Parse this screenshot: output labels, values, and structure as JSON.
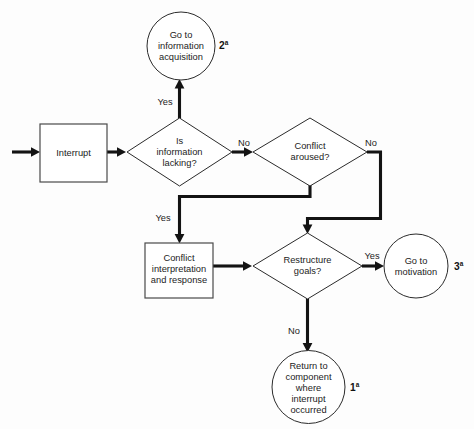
{
  "diagram": {
    "type": "flowchart",
    "background_color": "#fdfdfd",
    "line_color": "#131313",
    "shape_stroke_color": "#2b2b2b",
    "text_color": "#1c1c1c"
  },
  "nodes": {
    "go_to_information_acquisition": {
      "shape": "circle",
      "line1": "Go to",
      "line2": "information",
      "line3": "acquisition",
      "footnote": "2",
      "footnote_sup": "a"
    },
    "interrupt": {
      "shape": "rectangle",
      "label": "Interrupt"
    },
    "is_information_lacking": {
      "shape": "diamond",
      "line1": "Is",
      "line2": "information",
      "line3": "lacking?"
    },
    "conflict_aroused": {
      "shape": "diamond",
      "line1": "Conflict",
      "line2": "aroused?"
    },
    "conflict_interpretation": {
      "shape": "rectangle",
      "line1": "Conflict",
      "line2": "interpretation",
      "line3": "and response"
    },
    "restructure_goals": {
      "shape": "diamond",
      "line1": "Restructure",
      "line2": "goals?"
    },
    "go_to_motivation": {
      "shape": "circle",
      "line1": "Go to",
      "line2": "motivation",
      "footnote": "3",
      "footnote_sup": "a"
    },
    "return_to_component": {
      "shape": "circle",
      "line1": "Return to",
      "line2": "component",
      "line3": "where",
      "line4": "interrupt",
      "line5": "occurred",
      "footnote": "1",
      "footnote_sup": "a"
    }
  },
  "edges": {
    "entry_to_interrupt": {
      "label": ""
    },
    "interrupt_to_lacking": {
      "label": ""
    },
    "lacking_yes_to_information_acquisition": {
      "label": "Yes"
    },
    "lacking_no_to_conflict_aroused": {
      "label": "No"
    },
    "conflict_aroused_no_to_restructure": {
      "label": "No"
    },
    "conflict_aroused_yes_to_interpretation": {
      "label": "Yes"
    },
    "interpretation_to_restructure": {
      "label": ""
    },
    "restructure_yes_to_motivation": {
      "label": "Yes"
    },
    "restructure_no_to_return": {
      "label": "No"
    }
  }
}
